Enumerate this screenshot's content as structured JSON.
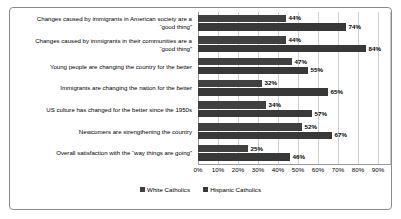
{
  "chart_data": {
    "type": "bar",
    "orientation": "horizontal",
    "title": "",
    "xlabel": "",
    "ylabel": "",
    "xlim": [
      0,
      90
    ],
    "grid": true,
    "legend_position": "bottom",
    "xticks": [
      "0%",
      "10%",
      "20%",
      "30%",
      "40%",
      "50%",
      "60%",
      "70%",
      "80%",
      "90%"
    ],
    "xtick_values": [
      0,
      10,
      20,
      30,
      40,
      50,
      60,
      70,
      80,
      90
    ],
    "categories": [
      "Changes caused by immigrants in American society are a\n“good thing”",
      "Changes caused by immigrants in their communities are a\n“good thing”",
      "Young people are changing the country for the better",
      "Immigrants are changing the nation for the better",
      "US culture has changed for the better since the 1950s",
      "Newcomers are strengthening the country",
      "Overall satisfaction with the “way things are going”"
    ],
    "series": [
      {
        "name": "White Catholics",
        "color": "#404040",
        "values": [
          44,
          44,
          47,
          32,
          34,
          52,
          25
        ],
        "labels": [
          "44%",
          "44%",
          "47%",
          "32%",
          "34%",
          "52%",
          "25%"
        ]
      },
      {
        "name": "Hispanic Catholics",
        "color": "#383838",
        "values": [
          74,
          84,
          55,
          65,
          57,
          67,
          46
        ],
        "labels": [
          "74%",
          "84%",
          "55%",
          "65%",
          "57%",
          "67%",
          "46%"
        ]
      }
    ]
  }
}
